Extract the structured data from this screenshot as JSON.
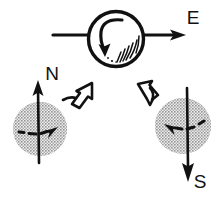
{
  "diagram": {
    "background_color": "#ffffff",
    "ink_color": "#111111",
    "blob_fill_color": "#b3b3b3",
    "width": 223,
    "height": 199,
    "labels": {
      "east": "E",
      "north": "N",
      "south": "S"
    },
    "elements": {
      "center_body_name": "rotating-sphere",
      "center_spin_direction": "counterclockwise",
      "motion_arrow_direction": "east",
      "left_sphere_axis_direction": "up",
      "left_sphere_spin_arrow_direction": "right",
      "right_sphere_axis_direction": "down",
      "right_sphere_spin_arrow_direction": "left",
      "hollow_arrow_left_direction": "up-right",
      "hollow_arrow_right_direction": "up-left"
    }
  }
}
